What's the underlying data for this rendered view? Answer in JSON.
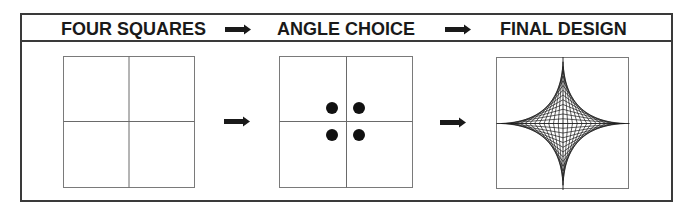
{
  "header": {
    "steps": [
      {
        "label": "FOUR SQUARES"
      },
      {
        "label": "ANGLE CHOICE"
      },
      {
        "label": "FINAL DESIGN"
      }
    ],
    "arrow_icon": "right-arrow-icon"
  },
  "panels": [
    {
      "name": "four-squares",
      "box": [
        63,
        56,
        132,
        131
      ],
      "divisions": 2
    },
    {
      "name": "angle-choice",
      "box": [
        279,
        56,
        134,
        131
      ],
      "divisions": 2,
      "dots": [
        [
          332,
          108
        ],
        [
          359,
          108
        ],
        [
          332,
          135
        ],
        [
          359,
          135
        ]
      ],
      "dot_radius": 6
    },
    {
      "name": "final-design",
      "box": [
        496,
        57,
        133,
        132
      ],
      "pattern": "string-art-astroid",
      "segments": 14
    }
  ],
  "colors": {
    "line": "#7a7a7a",
    "frame": "#3a3a3a",
    "ink": "#1a1a1a",
    "dot": "#111111"
  }
}
